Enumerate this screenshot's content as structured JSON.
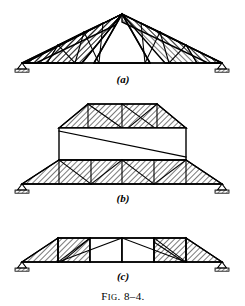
{
  "figure": {
    "caption_prefix": "F",
    "caption_small": "IG",
    "caption_rest": ". 8–4.",
    "caption_full": "Fig. 8–4.",
    "panels": [
      {
        "id": "a",
        "label": "(a)",
        "description": "Triangular roof truss with hatched web panels on both sloping sides and open apex triangle"
      },
      {
        "id": "b",
        "label": "(b)",
        "description": "Two-level truss: hatched upper trapezoidal truss, open rectangular middle story with single diagonal, hatched lower trapezoidal truss"
      },
      {
        "id": "c",
        "label": "(c)",
        "description": "Shallow trapezoidal truss with hatched end panels and open central panels"
      }
    ],
    "colors": {
      "ink": "#000000",
      "paper": "#ffffff",
      "hatch": "#000000"
    },
    "supports": {
      "type": "pin-with-ground-hatching",
      "count": 6
    }
  }
}
